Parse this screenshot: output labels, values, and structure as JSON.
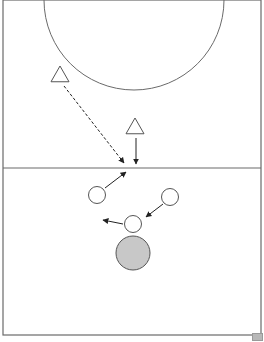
{
  "diagram": {
    "type": "sports-drill",
    "colors": {
      "line": "#6a6a6a",
      "arrow": "#222222",
      "shape_stroke": "#555555",
      "ball_fill": "#c8c8c8",
      "background": "#ffffff"
    },
    "court": {
      "left": 3,
      "top": 0,
      "right": 261,
      "bottom": 335,
      "midline_y": 168
    },
    "arc": {
      "cx": 134,
      "cy": 0,
      "r": 90
    },
    "attackers": [
      {
        "id": "triangle-1",
        "x": 60,
        "y": 75
      },
      {
        "id": "triangle-2",
        "x": 135,
        "y": 127
      }
    ],
    "defenders": [
      {
        "id": "circle-1",
        "x": 97,
        "y": 195
      },
      {
        "id": "circle-2",
        "x": 170,
        "y": 197
      },
      {
        "id": "circle-3",
        "x": 133,
        "y": 224
      }
    ],
    "ball": {
      "x": 133,
      "y": 253,
      "r": 17
    },
    "arrows": [
      {
        "id": "pass-dashed",
        "style": "dashed",
        "x1": 64,
        "y1": 86,
        "x2": 124,
        "y2": 163
      },
      {
        "id": "run-down",
        "style": "solid",
        "x1": 136,
        "y1": 138,
        "x2": 136,
        "y2": 164
      },
      {
        "id": "move-up",
        "style": "solid",
        "x1": 105,
        "y1": 188,
        "x2": 126,
        "y2": 172
      },
      {
        "id": "move-diag",
        "style": "solid",
        "x1": 163,
        "y1": 204,
        "x2": 146,
        "y2": 217
      },
      {
        "id": "move-left",
        "style": "solid",
        "x1": 123,
        "y1": 224,
        "x2": 103,
        "y2": 220
      }
    ]
  }
}
